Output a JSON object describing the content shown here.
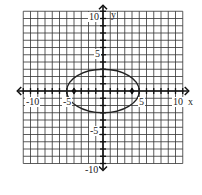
{
  "chart_data": {
    "type": "line",
    "title": "",
    "xlabel": "x",
    "ylabel": "y",
    "xlim": [
      -11,
      11
    ],
    "ylim": [
      -10,
      11
    ],
    "grid": true,
    "grid_step": 1,
    "x_tick_labels": [
      "-10",
      "-5",
      "5",
      "10"
    ],
    "y_tick_labels": [
      "10",
      "5",
      "-5",
      "-10"
    ],
    "series": [
      {
        "name": "ellipse",
        "shape": "ellipse",
        "center": [
          0,
          0
        ],
        "rx": 5,
        "ry": 3
      }
    ],
    "points": [
      {
        "name": "focus-left",
        "x": -4,
        "y": 0
      },
      {
        "name": "focus-right",
        "x": 4,
        "y": 0
      }
    ]
  },
  "labels": {
    "x_axis": "x",
    "y_axis": "y",
    "xm10": "-10",
    "xm5": "-5",
    "x5": "5",
    "x10": "10",
    "y10": "10",
    "y5": "5",
    "ym5": "-5",
    "ym10": "-10"
  }
}
